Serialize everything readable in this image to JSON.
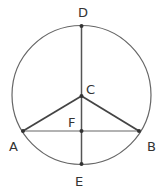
{
  "diagram": {
    "type": "circle-geometry",
    "colors": {
      "stroke": "#555555",
      "label": "#333333",
      "background": "#ffffff"
    },
    "circle": {
      "cx": 81.5,
      "cy": 95,
      "r": 69.5
    },
    "points": {
      "D": {
        "label": "D",
        "x": 81.5,
        "y": 26
      },
      "C": {
        "label": "C",
        "x": 81.5,
        "y": 96
      },
      "F": {
        "label": "F",
        "x": 81.5,
        "y": 131
      },
      "E": {
        "label": "E",
        "x": 81.5,
        "y": 164
      },
      "A": {
        "label": "A",
        "x": 23,
        "y": 131
      },
      "B": {
        "label": "B",
        "x": 139,
        "y": 131
      }
    },
    "segments": [
      "DE",
      "AB",
      "CA",
      "CB"
    ],
    "labels": {
      "D": "D",
      "C": "C",
      "F": "F",
      "A": "A",
      "B": "B",
      "E": "E"
    }
  }
}
